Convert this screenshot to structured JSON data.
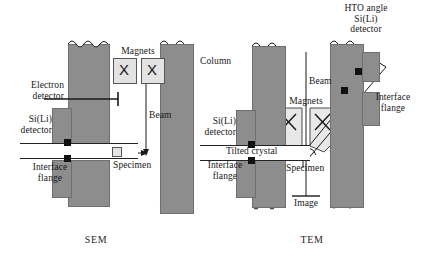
{
  "figure": {
    "panels": [
      {
        "id": "sem",
        "caption": "SEM",
        "labels": {
          "magnets": "Magnets",
          "electron_detector": "Electron\ndetector",
          "si_li_detector": "Si(Li)\ndetector",
          "interface_flange": "Interface\nflange",
          "beam": "Beam",
          "specimen": "Specimen"
        },
        "magnet_glyph": "X",
        "magnet_count": 2
      },
      {
        "id": "tem",
        "caption": "TEM",
        "labels": {
          "column": "Column",
          "magnets": "Magnets",
          "beam": "Beam",
          "si_li_detector": "Si(Li)\ndetector",
          "interface_flange_left": "Interface\nflange",
          "interface_flange_right": "Interface\nflange",
          "tilted_crystal": "Tilted crystal",
          "specimen": "Specimen",
          "image": "Image",
          "hto_detector": "HTO angle\nSi(Li)\ndetector"
        },
        "magnet_glyph": "X",
        "magnet_count": 2
      }
    ],
    "colors": {
      "column_fill": "#8d8d8d",
      "column_stroke": "#6f6f6f",
      "magnet_fill": "#e3e3e3",
      "ink": "#1a1a1a",
      "background": "#ffffff"
    }
  }
}
